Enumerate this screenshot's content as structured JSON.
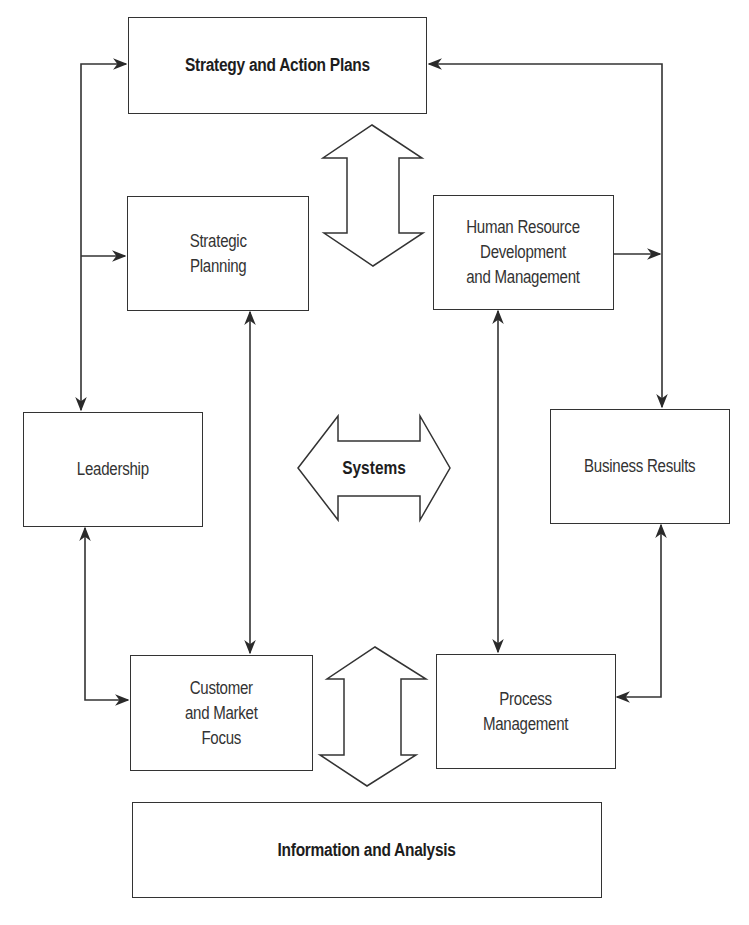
{
  "diagram": {
    "type": "management-system-framework",
    "nodes": {
      "strategy": {
        "label": "Strategy and Action Plans",
        "emphasis": "bold"
      },
      "strategic_planning": {
        "label": "Strategic\nPlanning"
      },
      "hr": {
        "label": "Human Resource\nDevelopment\nand Management"
      },
      "leadership": {
        "label": "Leadership"
      },
      "systems": {
        "label": "Systems",
        "emphasis": "bold",
        "shape": "double-arrow-horizontal"
      },
      "business_results": {
        "label": "Business Results"
      },
      "customer": {
        "label": "Customer\nand Market\nFocus"
      },
      "process": {
        "label": "Process\nManagement"
      },
      "information": {
        "label": "Information and Analysis",
        "emphasis": "bold"
      }
    },
    "edges": [
      {
        "from": "leadership",
        "to": "strategy",
        "direction": "bidirectional"
      },
      {
        "from": "leadership",
        "to": "strategic_planning",
        "direction": "to"
      },
      {
        "from": "business_results",
        "to": "strategy",
        "direction": "bidirectional"
      },
      {
        "from": "hr",
        "to": "business_results",
        "direction": "to"
      },
      {
        "from": "strategic_planning",
        "to": "customer",
        "direction": "bidirectional"
      },
      {
        "from": "hr",
        "to": "process",
        "direction": "bidirectional"
      },
      {
        "from": "leadership",
        "to": "customer",
        "direction": "bidirectional"
      },
      {
        "from": "business_results",
        "to": "process",
        "direction": "bidirectional"
      },
      {
        "from": "strategy",
        "to": "center",
        "direction": "bidirectional",
        "shape": "block-double-arrow-vertical"
      },
      {
        "from": "center",
        "to": "information",
        "direction": "bidirectional",
        "shape": "block-double-arrow-vertical"
      }
    ],
    "colors": {
      "stroke": "#333333",
      "background": "#ffffff",
      "text": "#2a2a2a"
    }
  }
}
